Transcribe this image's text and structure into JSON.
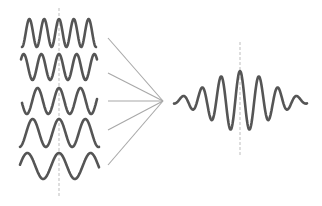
{
  "diagram": {
    "title": "",
    "colors": {
      "background": "#ffffff",
      "wave": "#555555",
      "connector": "#a8a8a8",
      "dashed_axis": "#bdbdbd"
    },
    "component_waves": [
      {
        "id": "wave-1",
        "center_y": 33,
        "x_start": 22,
        "x_end": 96,
        "amplitude": 14,
        "cycles": 5.0,
        "phase": 0
      },
      {
        "id": "wave-2",
        "center_y": 67,
        "x_start": 21,
        "x_end": 97,
        "amplitude": 13,
        "cycles": 4.3,
        "phase": 0
      },
      {
        "id": "wave-3",
        "center_y": 101,
        "x_start": 22,
        "x_end": 97,
        "amplitude": 13,
        "cycles": 3.5,
        "phase": 0
      },
      {
        "id": "wave-4",
        "center_y": 133,
        "x_start": 20,
        "x_end": 99,
        "amplitude": 14,
        "cycles": 3.0,
        "phase": 0
      },
      {
        "id": "wave-5",
        "center_y": 166,
        "x_start": 20,
        "x_end": 99,
        "amplitude": 13,
        "cycles": 2.5,
        "phase": 0
      }
    ],
    "left_axis": {
      "x": 59,
      "y_start": 8,
      "y_end": 196
    },
    "connectors": {
      "convergence_point": {
        "x": 163,
        "y": 101
      },
      "starts": [
        {
          "x": 108,
          "y": 38
        },
        {
          "x": 108,
          "y": 73
        },
        {
          "x": 108,
          "y": 101
        },
        {
          "x": 108,
          "y": 130
        },
        {
          "x": 108,
          "y": 165
        }
      ]
    },
    "result_wave": {
      "id": "wave-packet",
      "center_x": 240,
      "center_y": 101,
      "x_start": 174,
      "x_end": 307,
      "amplitude": 30,
      "carrier_period": 19,
      "envelope_sigma": 30
    },
    "right_axis": {
      "x": 240,
      "y_start": 42,
      "y_end": 155
    }
  }
}
